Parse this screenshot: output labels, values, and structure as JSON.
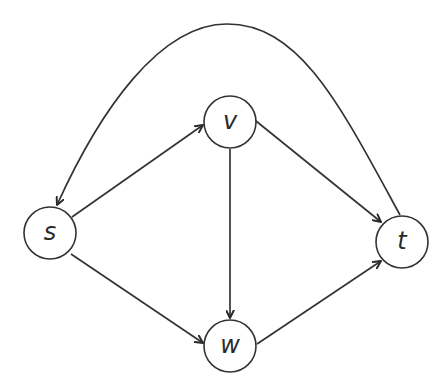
{
  "diagram": {
    "type": "directed-graph",
    "background": "#ffffff",
    "stroke_color": "#333333",
    "nodes": [
      {
        "id": "s",
        "label": "s",
        "cx": 50,
        "cy": 233,
        "r": 26
      },
      {
        "id": "v",
        "label": "v",
        "cx": 230,
        "cy": 122,
        "r": 26
      },
      {
        "id": "w",
        "label": "w",
        "cx": 230,
        "cy": 346,
        "r": 26
      },
      {
        "id": "t",
        "label": "t",
        "cx": 402,
        "cy": 242,
        "r": 26
      }
    ],
    "edges": [
      {
        "from": "s",
        "to": "v",
        "shape": "straight"
      },
      {
        "from": "s",
        "to": "w",
        "shape": "straight"
      },
      {
        "from": "v",
        "to": "w",
        "shape": "straight"
      },
      {
        "from": "v",
        "to": "t",
        "shape": "straight"
      },
      {
        "from": "w",
        "to": "t",
        "shape": "straight"
      },
      {
        "from": "t",
        "to": "s",
        "shape": "curved-arc-over-top"
      }
    ]
  }
}
